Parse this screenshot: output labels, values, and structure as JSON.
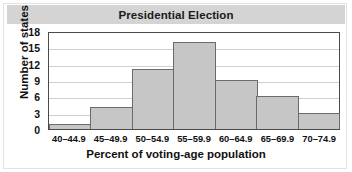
{
  "chart_data": {
    "type": "bar",
    "title": "Presidential Election",
    "xlabel": "Percent of voting-age population",
    "ylabel": "Number of states",
    "categories": [
      "40–44.9",
      "45–49.9",
      "50–54.9",
      "55–59.9",
      "60–64.9",
      "65–69.9",
      "70–74.9"
    ],
    "values": [
      1,
      4,
      11,
      16,
      9,
      6,
      3
    ],
    "ylim": [
      0,
      18
    ],
    "yticks": [
      0,
      3,
      6,
      9,
      12,
      15,
      18
    ],
    "ytick_labels": [
      "0",
      "3",
      "6",
      "9",
      "12",
      "15",
      "18"
    ],
    "grid": true,
    "legend": "none",
    "colors": {
      "bar_fill": "#c6c6c6",
      "bar_border": "#6b6b6b",
      "title_band": "#d4d4d4",
      "gridline": "#cfcfcf",
      "axis": "#4a4a4a",
      "text": "#111111",
      "background": "#ffffff"
    }
  }
}
